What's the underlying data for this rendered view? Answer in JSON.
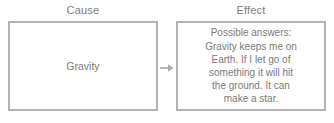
{
  "diagram": {
    "type": "cause-and-effect-organizer",
    "columns": [
      {
        "heading": "Cause",
        "content": "Gravity"
      },
      {
        "heading": "Effect",
        "content": "Possible answers:\nGravity keeps me on\nEarth. If I let go of\nsomething it will hit\nthe ground. It can\nmake a star."
      }
    ],
    "connector": {
      "icon": "arrow-right-icon"
    },
    "colors": {
      "border": "#b2b2b2",
      "text": "#7a7a7a",
      "heading": "#7c7c7c",
      "background": "#ffffff"
    }
  }
}
